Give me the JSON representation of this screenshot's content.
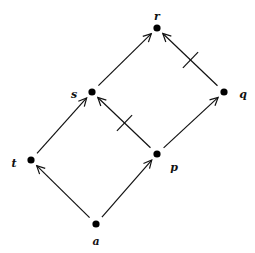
{
  "diagram": {
    "type": "hasse-diagram",
    "nodes": [
      {
        "id": "r",
        "label": "r",
        "x": 157,
        "y": 28,
        "lx": 157,
        "ly": 17
      },
      {
        "id": "s",
        "label": "s",
        "x": 92,
        "y": 92,
        "lx": 74,
        "ly": 95
      },
      {
        "id": "q",
        "label": "q",
        "x": 224,
        "y": 92,
        "lx": 243,
        "ly": 95
      },
      {
        "id": "t",
        "label": "t",
        "x": 31,
        "y": 160,
        "lx": 14,
        "ly": 164
      },
      {
        "id": "p",
        "label": "p",
        "x": 157,
        "y": 154,
        "lx": 174,
        "ly": 168
      },
      {
        "id": "a",
        "label": "a",
        "x": 96,
        "y": 224,
        "lx": 96,
        "ly": 242
      }
    ],
    "edges": [
      {
        "from": "a",
        "to": "t",
        "negated": false
      },
      {
        "from": "a",
        "to": "p",
        "negated": false
      },
      {
        "from": "t",
        "to": "s",
        "negated": false
      },
      {
        "from": "p",
        "to": "s",
        "negated": true
      },
      {
        "from": "p",
        "to": "q",
        "negated": false
      },
      {
        "from": "s",
        "to": "r",
        "negated": false
      },
      {
        "from": "q",
        "to": "r",
        "negated": true
      }
    ],
    "colors": {
      "stroke": "#111111",
      "node": "#000000",
      "background": "#ffffff"
    }
  }
}
